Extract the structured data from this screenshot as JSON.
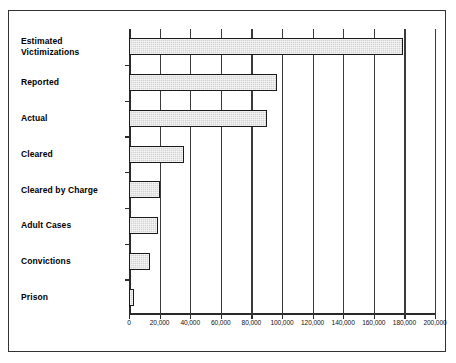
{
  "chart_data": {
    "type": "bar",
    "orientation": "horizontal",
    "title": "",
    "subtitle": "",
    "xlabel": "",
    "ylabel": "",
    "categories": [
      "Estimated Victimizations",
      "Reported",
      "Actual",
      "Cleared",
      "Cleared by Charge",
      "Adult Cases",
      "Convictions",
      "Prison"
    ],
    "category_lines": [
      [
        "Estimated",
        "Victimizations"
      ],
      [
        "Reported"
      ],
      [
        "Actual"
      ],
      [
        "Cleared"
      ],
      [
        "Cleared by Charge"
      ],
      [
        "Adult Cases"
      ],
      [
        "Convictions"
      ],
      [
        "Prison"
      ]
    ],
    "values": [
      179000,
      97000,
      90000,
      36000,
      20000,
      19000,
      14000,
      3500
    ],
    "xlim": [
      0,
      200000
    ],
    "xticks": [
      0,
      20000,
      40000,
      60000,
      80000,
      100000,
      120000,
      140000,
      160000,
      180000,
      200000
    ],
    "xticklabels": [
      "0",
      "20,000",
      "40,000",
      "60,000",
      "80,000",
      "100,000",
      "120,000",
      "140,000",
      "160,000",
      "180,000",
      "200,000"
    ],
    "grid": true,
    "grid_axis": "x",
    "legend": false,
    "legend_position": "none",
    "bar_fill_color": "#d2d2d2",
    "bar_border_color": "#1a1a1a",
    "axis_color": "#2a2a2a",
    "grid_color": "#3a3a3a",
    "frame_color": "#333333",
    "background_color": "#ffffff"
  }
}
